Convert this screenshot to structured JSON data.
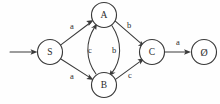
{
  "diagram": {
    "kind": "state-transition-diagram",
    "background_color": "#fefefe",
    "line_color": "#3a3a3a",
    "text_color": "#2b2b2b",
    "nodes": [
      {
        "id": "S",
        "label": "S",
        "cx": 50,
        "cy": 52,
        "r": 12.5
      },
      {
        "id": "A",
        "label": "A",
        "cx": 104,
        "cy": 15,
        "r": 12.5
      },
      {
        "id": "B",
        "label": "B",
        "cx": 104,
        "cy": 85,
        "r": 12.5
      },
      {
        "id": "C",
        "label": "C",
        "cx": 152,
        "cy": 52,
        "r": 12.5
      },
      {
        "id": "E",
        "label": "Ø",
        "cx": 204,
        "cy": 52,
        "r": 12.5
      }
    ],
    "start_arrow": {
      "from_x": 10,
      "to_x": 37,
      "y": 52
    },
    "edges": [
      {
        "id": "S-A",
        "from": "S",
        "to": "A",
        "label": "a",
        "label_x": 72,
        "label_y": 26
      },
      {
        "id": "S-B",
        "from": "S",
        "to": "B",
        "label": "a",
        "label_x": 72,
        "label_y": 76
      },
      {
        "id": "A-C",
        "from": "A",
        "to": "C",
        "label": "b",
        "label_x": 129,
        "label_y": 25
      },
      {
        "id": "A-B",
        "from": "A",
        "to": "B",
        "label": "b",
        "label_x": 114,
        "label_y": 50
      },
      {
        "id": "B-A",
        "from": "B",
        "to": "A",
        "label": "c",
        "label_x": 90,
        "label_y": 50
      },
      {
        "id": "B-C",
        "from": "B",
        "to": "C",
        "label": "c",
        "label_x": 130,
        "label_y": 75
      },
      {
        "id": "C-E",
        "from": "C",
        "to": "E",
        "label": "a",
        "label_x": 178,
        "label_y": 42
      }
    ]
  }
}
